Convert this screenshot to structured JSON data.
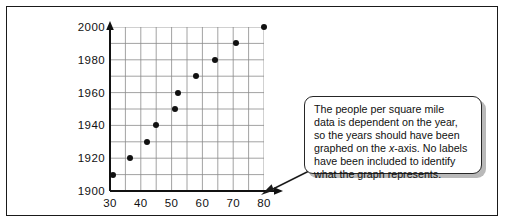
{
  "figure": {
    "outer_border_color": "#1a1a1a",
    "background": "#ffffff"
  },
  "callout": {
    "name": "annotation-callout",
    "line1": "The people per square mile",
    "line2": "data is dependent on the year,",
    "line3": "so the years should have been",
    "line4_a": "graphed on the ",
    "line4_italic": "x",
    "line4_b": "-axis. No labels",
    "line5": "have been included to identify",
    "line6": "what the graph represents.",
    "full_text": "The people per square mile data is dependent on the year, so the years should have been graphed on the x-axis. No labels have been included to identify what the graph represents.",
    "border_color": "#262626",
    "shadow_color": "#b9b9b9",
    "pointer_target": "x-axis-arrow"
  },
  "chart_data": {
    "type": "scatter",
    "title": "",
    "xlabel": "",
    "ylabel": "",
    "xlim": [
      30,
      80
    ],
    "ylim": [
      1900,
      2000
    ],
    "xticks": [
      30,
      40,
      50,
      60,
      70,
      80
    ],
    "yticks": [
      1900,
      1920,
      1940,
      1960,
      1980,
      2000
    ],
    "xtick_labels": [
      "30",
      "40",
      "50",
      "60",
      "70",
      "80"
    ],
    "ytick_labels": [
      "1900",
      "1920",
      "1940",
      "1960",
      "1980",
      "2000"
    ],
    "grid": true,
    "grid_x_step": 5,
    "grid_y_step": 10,
    "grid_color": "#8a8a8a",
    "axis_color": "#111111",
    "point_color": "#111111",
    "point_radius_px": 3,
    "legend": null,
    "x_axis_arrow": true,
    "y_axis_arrow": true,
    "points": [
      {
        "x": 31,
        "y": 1910
      },
      {
        "x": 36.5,
        "y": 1920
      },
      {
        "x": 42,
        "y": 1930
      },
      {
        "x": 45,
        "y": 1940
      },
      {
        "x": 51,
        "y": 1950
      },
      {
        "x": 52,
        "y": 1960
      },
      {
        "x": 58,
        "y": 1970
      },
      {
        "x": 64,
        "y": 1980
      },
      {
        "x": 71,
        "y": 1990
      },
      {
        "x": 80,
        "y": 2000
      }
    ],
    "series": [
      {
        "name": "year vs people per square mile",
        "x": [
          31,
          36.5,
          42,
          45,
          51,
          52,
          58,
          64,
          71,
          80
        ],
        "values": [
          1910,
          1920,
          1930,
          1940,
          1950,
          1960,
          1970,
          1980,
          1990,
          2000
        ]
      }
    ]
  }
}
